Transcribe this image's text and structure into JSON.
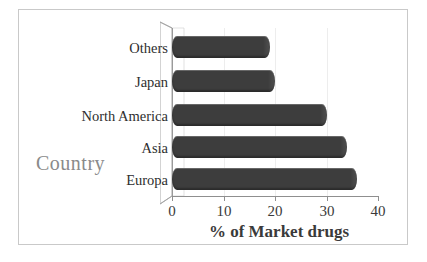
{
  "chart_data": {
    "type": "bar",
    "orientation": "horizontal",
    "title": "",
    "xlabel": "% of Market drugs",
    "ylabel": "Country",
    "categories": [
      "Europa",
      "Asia",
      "North America",
      "Japan",
      "Others"
    ],
    "values": [
      36,
      34,
      30,
      20,
      19
    ],
    "xlim": [
      0,
      40
    ],
    "xticks": [
      0,
      10,
      20,
      30,
      40
    ],
    "xtick_labels": [
      "0",
      "10",
      "20",
      "30",
      "40"
    ],
    "grid": false,
    "legend": null,
    "series": [
      {
        "name": "% of Market drugs",
        "values": [
          36,
          34,
          30,
          20,
          19
        ]
      }
    ],
    "bar_color": "#3d3d3d",
    "axis_color": "#8f8f8f",
    "ylabel_color": "#8a8a8a",
    "xlabel_color": "#3a3a3a",
    "border_color": "#c9c9c9",
    "background": "#ffffff",
    "style": "3d-perspective-wall"
  },
  "chart": {
    "y_axis_title": "Country",
    "x_axis_title": "% of Market drugs",
    "rows": [
      {
        "label": "Others",
        "value": 19
      },
      {
        "label": "Japan",
        "value": 20
      },
      {
        "label": "North America",
        "value": 30
      },
      {
        "label": "Asia",
        "value": 34
      },
      {
        "label": "Europa",
        "value": 36
      }
    ],
    "x_ticks": [
      {
        "label": "0",
        "value": 0
      },
      {
        "label": "10",
        "value": 10
      },
      {
        "label": "20",
        "value": 20
      },
      {
        "label": "30",
        "value": 30
      },
      {
        "label": "40",
        "value": 40
      }
    ]
  }
}
